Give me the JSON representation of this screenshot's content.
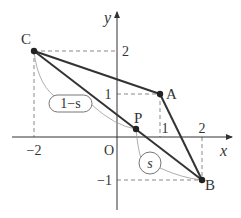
{
  "diagram": {
    "axes": {
      "x_label": "x",
      "y_label": "y",
      "origin_label": "O",
      "x_ticks": [
        {
          "value": -2,
          "label": "−2"
        },
        {
          "value": 1,
          "label": "1"
        },
        {
          "value": 2,
          "label": "2"
        }
      ],
      "y_ticks": [
        {
          "value": 2,
          "label": "2"
        },
        {
          "value": 1,
          "label": "1"
        },
        {
          "value": -1,
          "label": "−1"
        }
      ]
    },
    "points": {
      "A": {
        "label": "A",
        "coords": [
          1,
          1
        ]
      },
      "B": {
        "label": "B",
        "coords": [
          2,
          -1
        ]
      },
      "C": {
        "label": "C",
        "coords": [
          -2,
          2
        ]
      },
      "P": {
        "label": "P"
      }
    },
    "segments": [
      "CA",
      "AB",
      "CB"
    ],
    "ratio_labels": {
      "cp": "1−s",
      "pb": "s"
    },
    "colors": {
      "line": "#333333",
      "dashed": "#888888",
      "arc": "#999999"
    }
  }
}
